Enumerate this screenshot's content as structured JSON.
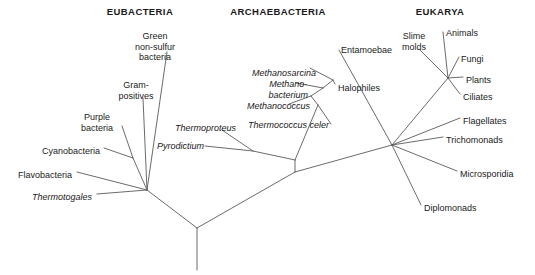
{
  "figure": {
    "kind": "unrooted-phylogenetic-tree",
    "width": 535,
    "height": 275,
    "background": "#ffffff",
    "line_color": "#5a5a5a",
    "text_color": "#1a1a1a"
  },
  "headers": [
    {
      "id": "eubacteria",
      "label": "EUBACTERIA",
      "x": 140,
      "y": 6
    },
    {
      "id": "archaebacteria",
      "label": "ARCHAEBACTERIA",
      "x": 278,
      "y": 6
    },
    {
      "id": "eukarya",
      "label": "EUKARYA",
      "x": 440,
      "y": 6
    }
  ],
  "taxa": [
    {
      "id": "green-non-sulfur-bacteria",
      "label": "Green\nnon-sulfur\nbacteria",
      "domain": "EUBACTERIA",
      "italic": false,
      "x": 155,
      "y": 31,
      "anchor": "mid"
    },
    {
      "id": "gram-positives",
      "label": "Gram-\npositives",
      "domain": "EUBACTERIA",
      "italic": false,
      "x": 136,
      "y": 80,
      "anchor": "mid"
    },
    {
      "id": "purple-bacteria",
      "label": "Purple\nbacteria",
      "domain": "EUBACTERIA",
      "italic": false,
      "x": 97,
      "y": 112,
      "anchor": "mid"
    },
    {
      "id": "cyanobacteria",
      "label": "Cyanobacteria",
      "domain": "EUBACTERIA",
      "italic": false,
      "x": 100,
      "y": 146,
      "anchor": "end"
    },
    {
      "id": "flavobacteria",
      "label": "Flavobacteria",
      "domain": "EUBACTERIA",
      "italic": false,
      "x": 72,
      "y": 170,
      "anchor": "end"
    },
    {
      "id": "thermotogales",
      "label": "Thermotogales",
      "domain": "EUBACTERIA",
      "italic": true,
      "x": 92,
      "y": 192,
      "anchor": "end"
    },
    {
      "id": "methanosarcina",
      "label": "Methanosarcina",
      "domain": "ARCHAEBACTERIA",
      "italic": true,
      "x": 316,
      "y": 68,
      "anchor": "end"
    },
    {
      "id": "methanobacterium",
      "label": "Methano-\nbacterium",
      "domain": "ARCHAEBACTERIA",
      "italic": true,
      "x": 308,
      "y": 79,
      "anchor": "end"
    },
    {
      "id": "methanococcus",
      "label": "Methanococcus",
      "domain": "ARCHAEBACTERIA",
      "italic": true,
      "x": 310,
      "y": 101,
      "anchor": "end"
    },
    {
      "id": "thermococcus-celer",
      "label": "Thermococcus celer",
      "domain": "ARCHAEBACTERIA",
      "italic": true,
      "x": 329,
      "y": 120,
      "anchor": "end"
    },
    {
      "id": "halophiles",
      "label": "Halophiles",
      "domain": "ARCHAEBACTERIA",
      "italic": false,
      "x": 338,
      "y": 83,
      "anchor": "start"
    },
    {
      "id": "thermoproteus",
      "label": "Thermoproteus",
      "domain": "ARCHAEBACTERIA",
      "italic": true,
      "x": 175,
      "y": 123,
      "anchor": "start"
    },
    {
      "id": "pyrodictium",
      "label": "Pyrodictium",
      "domain": "ARCHAEBACTERIA",
      "italic": true,
      "x": 157,
      "y": 141,
      "anchor": "start"
    },
    {
      "id": "entamoebae",
      "label": "Entamoebae",
      "domain": "EUKARYA",
      "italic": false,
      "x": 341,
      "y": 45,
      "anchor": "start"
    },
    {
      "id": "slime-molds",
      "label": "Slime\nmolds",
      "domain": "EUKARYA",
      "italic": false,
      "x": 414,
      "y": 31,
      "anchor": "mid"
    },
    {
      "id": "animals",
      "label": "Animals",
      "domain": "EUKARYA",
      "italic": false,
      "x": 446,
      "y": 28,
      "anchor": "start"
    },
    {
      "id": "fungi",
      "label": "Fungi",
      "domain": "EUKARYA",
      "italic": false,
      "x": 461,
      "y": 54,
      "anchor": "start"
    },
    {
      "id": "plants",
      "label": "Plants",
      "domain": "EUKARYA",
      "italic": false,
      "x": 466,
      "y": 75,
      "anchor": "start"
    },
    {
      "id": "ciliates",
      "label": "Ciliates",
      "domain": "EUKARYA",
      "italic": false,
      "x": 463,
      "y": 92,
      "anchor": "start"
    },
    {
      "id": "flagellates",
      "label": "Flagellates",
      "domain": "EUKARYA",
      "italic": false,
      "x": 463,
      "y": 116,
      "anchor": "start"
    },
    {
      "id": "trichomonads",
      "label": "Trichomonads",
      "domain": "EUKARYA",
      "italic": false,
      "x": 446,
      "y": 135,
      "anchor": "start"
    },
    {
      "id": "microsporidia",
      "label": "Microsporidia",
      "domain": "EUKARYA",
      "italic": false,
      "x": 460,
      "y": 169,
      "anchor": "start"
    },
    {
      "id": "diplomonads",
      "label": "Diplomonads",
      "domain": "EUKARYA",
      "italic": false,
      "x": 424,
      "y": 203,
      "anchor": "start"
    }
  ],
  "branches": [
    {
      "id": "root-stem",
      "from": [
        197,
        228
      ],
      "to": [
        197,
        270
      ]
    },
    {
      "id": "root-to-eubacteria-node",
      "from": [
        197,
        228
      ],
      "to": [
        147,
        190
      ]
    },
    {
      "id": "root-to-archaea-eukarya-node",
      "from": [
        197,
        228
      ],
      "to": [
        295,
        172
      ]
    },
    {
      "id": "eubacteria-node-to-green-non-sulfur",
      "from": [
        147,
        190
      ],
      "to": [
        167,
        52
      ]
    },
    {
      "id": "eubacteria-node-to-gram-positives",
      "from": [
        147,
        190
      ],
      "to": [
        143,
        98
      ]
    },
    {
      "id": "eubacteria-node-to-purple-cyano-node",
      "from": [
        147,
        190
      ],
      "to": [
        133,
        158
      ]
    },
    {
      "id": "purple-cyano-node-to-purple",
      "from": [
        133,
        158
      ],
      "to": [
        122,
        126
      ]
    },
    {
      "id": "purple-cyano-node-to-cyano",
      "from": [
        133,
        158
      ],
      "to": [
        104,
        148
      ]
    },
    {
      "id": "eubacteria-node-to-flavobacteria",
      "from": [
        147,
        190
      ],
      "to": [
        77,
        172
      ]
    },
    {
      "id": "eubacteria-node-to-thermotogales",
      "from": [
        147,
        190
      ],
      "to": [
        97,
        194
      ]
    },
    {
      "id": "archaea-eukarya-node-to-archaea-node",
      "from": [
        295,
        172
      ],
      "to": [
        295,
        160
      ]
    },
    {
      "id": "archaea-node-to-crenarchaeota-node",
      "from": [
        295,
        160
      ],
      "to": [
        253,
        151
      ]
    },
    {
      "id": "crenarchaeota-node-to-thermoproteus",
      "from": [
        253,
        151
      ],
      "to": [
        222,
        130
      ]
    },
    {
      "id": "crenarchaeota-node-to-pyrodictium",
      "from": [
        253,
        151
      ],
      "to": [
        205,
        146
      ]
    },
    {
      "id": "archaea-node-to-euryarchaeota-node",
      "from": [
        295,
        160
      ],
      "to": [
        318,
        105
      ]
    },
    {
      "id": "euryarchaeota-node-to-thermococcus",
      "from": [
        318,
        105
      ],
      "to": [
        331,
        124
      ]
    },
    {
      "id": "euryarchaeota-stem-a",
      "from": [
        318,
        105
      ],
      "to": [
        311,
        96
      ]
    },
    {
      "id": "euryarchaeota-node-to-methanococcus",
      "from": [
        311,
        96
      ],
      "to": [
        289,
        104
      ]
    },
    {
      "id": "euryarchaeota-stem-b",
      "from": [
        311,
        96
      ],
      "to": [
        323,
        88
      ]
    },
    {
      "id": "euryarchaeota-node-to-methanobacterium",
      "from": [
        323,
        88
      ],
      "to": [
        296,
        83
      ]
    },
    {
      "id": "euryarchaeota-stem-c",
      "from": [
        323,
        88
      ],
      "to": [
        333,
        80
      ]
    },
    {
      "id": "euryarchaeota-node-to-methanosarcina",
      "from": [
        333,
        80
      ],
      "to": [
        310,
        68
      ]
    },
    {
      "id": "euryarchaeota-node-to-halophiles",
      "from": [
        333,
        80
      ],
      "to": [
        335,
        84
      ]
    },
    {
      "id": "archaea-eukarya-node-to-eukarya-node",
      "from": [
        295,
        172
      ],
      "to": [
        392,
        145
      ]
    },
    {
      "id": "eukarya-node-to-entamoebae",
      "from": [
        392,
        145
      ],
      "to": [
        339,
        50
      ]
    },
    {
      "id": "eukarya-node-to-crown-node",
      "from": [
        392,
        145
      ],
      "to": [
        448,
        78
      ]
    },
    {
      "id": "eukarya-node-to-flagellates",
      "from": [
        392,
        145
      ],
      "to": [
        460,
        118
      ]
    },
    {
      "id": "eukarya-node-to-trichomonads",
      "from": [
        392,
        145
      ],
      "to": [
        443,
        137
      ]
    },
    {
      "id": "eukarya-node-to-microsporidia",
      "from": [
        392,
        145
      ],
      "to": [
        457,
        171
      ]
    },
    {
      "id": "eukarya-node-to-diplomonads",
      "from": [
        392,
        145
      ],
      "to": [
        421,
        205
      ]
    },
    {
      "id": "crown-node-to-slime-molds",
      "from": [
        448,
        78
      ],
      "to": [
        420,
        50
      ]
    },
    {
      "id": "crown-node-to-animals",
      "from": [
        448,
        78
      ],
      "to": [
        443,
        32
      ]
    },
    {
      "id": "crown-node-to-fungi",
      "from": [
        448,
        78
      ],
      "to": [
        459,
        57
      ]
    },
    {
      "id": "crown-node-to-plants",
      "from": [
        448,
        78
      ],
      "to": [
        463,
        77
      ]
    },
    {
      "id": "crown-node-to-ciliates",
      "from": [
        448,
        78
      ],
      "to": [
        460,
        94
      ]
    }
  ]
}
